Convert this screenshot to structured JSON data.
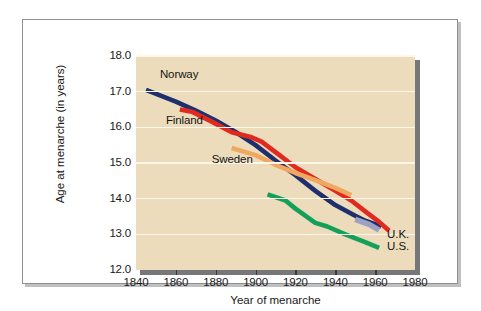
{
  "chart_data": {
    "type": "line",
    "title": "",
    "xlabel": "Year of menarche",
    "ylabel": "Age at menarche (in years)",
    "xlim": [
      1840,
      1980
    ],
    "ylim": [
      12.0,
      18.0
    ],
    "xticks": [
      1840,
      1860,
      1880,
      1900,
      1920,
      1940,
      1960,
      1980
    ],
    "xticklabels": [
      "1840",
      "1860",
      "1880",
      "1900",
      "1920",
      "1940",
      "1960",
      "1980"
    ],
    "yticks": [
      12.0,
      13.0,
      14.0,
      15.0,
      16.0,
      17.0,
      18.0
    ],
    "yticklabels": [
      "12.0",
      "13.0",
      "14.0",
      "15.0",
      "16.0",
      "17.0",
      "18.0"
    ],
    "grid": "horizontal",
    "grid_color": "#fdf6ea",
    "plot_background": "#ecdcbc",
    "legend_position": "inline-labels",
    "series": [
      {
        "name": "Norway",
        "color": "#1f2f6e",
        "label_position": "upper-left",
        "points": [
          [
            1845,
            17.05
          ],
          [
            1860,
            16.72
          ],
          [
            1870,
            16.47
          ],
          [
            1880,
            16.19
          ],
          [
            1890,
            15.87
          ],
          [
            1900,
            15.5
          ],
          [
            1910,
            15.07
          ],
          [
            1920,
            14.66
          ],
          [
            1930,
            14.22
          ],
          [
            1940,
            13.82
          ],
          [
            1950,
            13.52
          ],
          [
            1955,
            13.38
          ],
          [
            1963,
            13.22
          ]
        ]
      },
      {
        "name": "Finland",
        "color": "#e02a20",
        "label_position": "left",
        "points": [
          [
            1862,
            16.5
          ],
          [
            1868,
            16.44
          ],
          [
            1878,
            16.16
          ],
          [
            1888,
            15.86
          ],
          [
            1898,
            15.72
          ],
          [
            1903,
            15.6
          ],
          [
            1912,
            15.22
          ],
          [
            1920,
            14.88
          ],
          [
            1930,
            14.55
          ],
          [
            1940,
            14.22
          ],
          [
            1948,
            13.95
          ],
          [
            1956,
            13.6
          ],
          [
            1962,
            13.35
          ],
          [
            1967,
            13.1
          ]
        ]
      },
      {
        "name": "Sweden",
        "color": "#f0a860",
        "label_position": "middle-left",
        "points": [
          [
            1888,
            15.42
          ],
          [
            1900,
            15.22
          ],
          [
            1910,
            14.95
          ],
          [
            1920,
            14.72
          ],
          [
            1930,
            14.52
          ],
          [
            1940,
            14.3
          ],
          [
            1948,
            14.1
          ]
        ]
      },
      {
        "name": "U.S.",
        "color": "#14a05a",
        "label_position": "right-lower",
        "points": [
          [
            1906,
            14.12
          ],
          [
            1915,
            13.95
          ],
          [
            1920,
            13.72
          ],
          [
            1930,
            13.32
          ],
          [
            1936,
            13.22
          ],
          [
            1945,
            13.0
          ],
          [
            1955,
            12.78
          ],
          [
            1962,
            12.62
          ]
        ]
      },
      {
        "name": "U.K.",
        "color": "#9ea0c4",
        "label_position": "right-upper",
        "points": [
          [
            1950,
            13.42
          ],
          [
            1957,
            13.28
          ],
          [
            1962,
            13.12
          ]
        ]
      }
    ],
    "annotations": [
      {
        "text": "Norway",
        "x": 1852,
        "y": 17.45
      },
      {
        "text": "Finland",
        "x": 1855,
        "y": 16.15
      },
      {
        "text": "Sweden",
        "x": 1878,
        "y": 15.05
      },
      {
        "text": "U.K.",
        "x": 1966,
        "y": 12.95
      },
      {
        "text": "U.S.",
        "x": 1966,
        "y": 12.62
      }
    ]
  }
}
